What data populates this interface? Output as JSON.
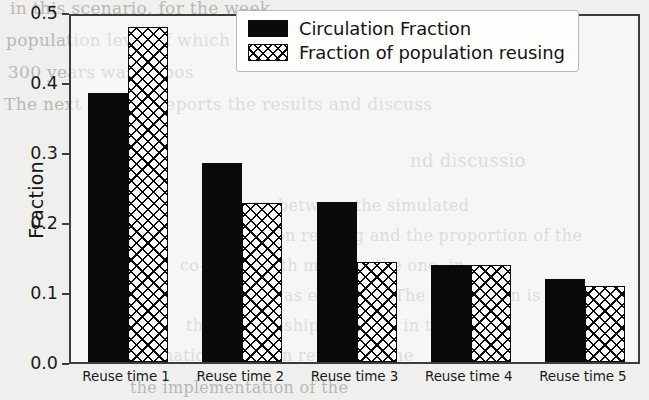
{
  "chart_data": {
    "type": "bar",
    "title": "",
    "xlabel": "",
    "ylabel": "Fraction",
    "ylim": [
      0.0,
      0.5
    ],
    "yticks": [
      "0.0",
      "0.1",
      "0.2",
      "0.3",
      "0.4",
      "0.5"
    ],
    "ytick_values": [
      0.0,
      0.1,
      0.2,
      0.3,
      0.4,
      0.5
    ],
    "grid": false,
    "legend_position": "upper right",
    "categories": [
      "Reuse time 1",
      "Reuse time 2",
      "Reuse time 3",
      "Reuse time 4",
      "Reuse time 5"
    ],
    "series": [
      {
        "name": "Circulation Fraction",
        "style": "solid-black",
        "color": "#0a0a0a",
        "values": [
          0.385,
          0.285,
          0.228,
          0.139,
          0.118
        ]
      },
      {
        "name": "Fraction of population reusing",
        "style": "cross-hatch",
        "color": "#0a0a0a",
        "values": [
          0.479,
          0.227,
          0.143,
          0.139,
          0.109
        ]
      }
    ]
  },
  "legend": {
    "entries": [
      {
        "label": "Circulation Fraction"
      },
      {
        "label": "Fraction of population reusing"
      }
    ]
  },
  "background_text": {
    "lines": [
      "in this scenario, for the week",
      "population level of which necessa",
      "300 years was impos",
      "The next section reports the results and discuss",
      "nd discussio",
      "on between the  simulated",
      "population reusing and the proportion of the",
      "co-relays with more or the one, in ,",
      "on as expected. The expression is",
      "the relationship obtained in the",
      "mination between reuse and the",
      "the implementation of the"
    ]
  }
}
